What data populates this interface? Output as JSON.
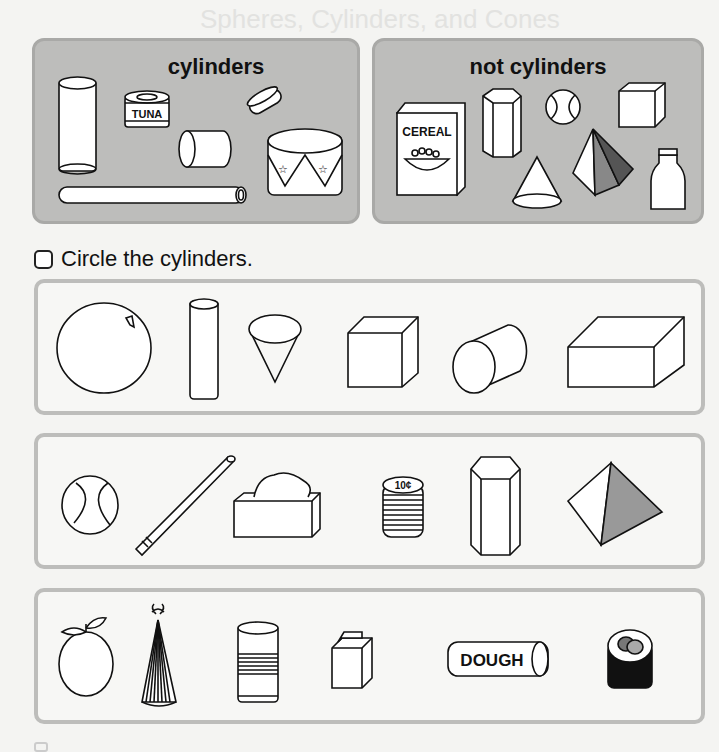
{
  "page": {
    "title": "Spheres, Cylinders, and Cones"
  },
  "sort_boxes": [
    {
      "title": "cylinders",
      "items": [
        {
          "name": "glass",
          "label": ""
        },
        {
          "name": "tuna-can",
          "label": "TUNA"
        },
        {
          "name": "checker-piece",
          "label": ""
        },
        {
          "name": "cylinder-block",
          "label": ""
        },
        {
          "name": "toy-drum",
          "label": ""
        },
        {
          "name": "pipe",
          "label": ""
        }
      ]
    },
    {
      "title": "not cylinders",
      "items": [
        {
          "name": "cereal-box",
          "label": "CEREAL"
        },
        {
          "name": "hexagonal-prism",
          "label": ""
        },
        {
          "name": "tennis-ball",
          "label": ""
        },
        {
          "name": "cube",
          "label": ""
        },
        {
          "name": "cone",
          "label": ""
        },
        {
          "name": "pyramid",
          "label": ""
        },
        {
          "name": "milk-bottle",
          "label": ""
        }
      ]
    }
  ],
  "instruction": {
    "text": "Circle the cylinders."
  },
  "rows": [
    {
      "items": [
        {
          "name": "sphere",
          "is_cylinder": false
        },
        {
          "name": "tall-cylinder",
          "is_cylinder": true
        },
        {
          "name": "cone",
          "is_cylinder": false
        },
        {
          "name": "cube",
          "is_cylinder": false
        },
        {
          "name": "tilted-cylinder",
          "is_cylinder": true
        },
        {
          "name": "rectangular-prism",
          "is_cylinder": false
        }
      ]
    },
    {
      "items": [
        {
          "name": "tennis-ball",
          "is_cylinder": false
        },
        {
          "name": "straw",
          "is_cylinder": true
        },
        {
          "name": "tissue-box",
          "is_cylinder": false
        },
        {
          "name": "coin-stack",
          "is_cylinder": true,
          "label": "10¢"
        },
        {
          "name": "hexagonal-prism",
          "is_cylinder": false
        },
        {
          "name": "pyramid",
          "is_cylinder": false
        }
      ]
    },
    {
      "items": [
        {
          "name": "orange",
          "is_cylinder": false
        },
        {
          "name": "party-hat",
          "is_cylinder": false
        },
        {
          "name": "can",
          "is_cylinder": true
        },
        {
          "name": "block",
          "is_cylinder": false
        },
        {
          "name": "dough-tube",
          "is_cylinder": true,
          "label": "DOUGH"
        },
        {
          "name": "sushi-roll",
          "is_cylinder": true
        }
      ]
    }
  ]
}
